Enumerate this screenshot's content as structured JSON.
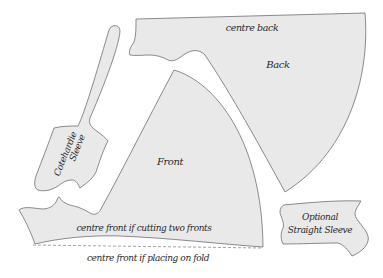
{
  "diagram": {
    "type": "sewing-pattern-layout",
    "colors": {
      "piece_fill": "#e9e9e9",
      "outline": "#6f6f6f",
      "fold_line": "#8a8a8a",
      "text": "#2a2a2a",
      "background": "#ffffff"
    },
    "pieces": {
      "back": {
        "label": "Back",
        "edge_label": "centre back"
      },
      "front": {
        "label": "Front",
        "edge_label": "centre front if cutting two fronts"
      },
      "cotehardie_sleeve": {
        "label_line1": "Cotehardie",
        "label_line2": "Sleeve"
      },
      "straight_sleeve": {
        "label_line1": "Optional",
        "label_line2": "Straight Sleeve"
      }
    },
    "fold_line": {
      "label": "centre front if placing on fold",
      "style": "dashed"
    }
  }
}
